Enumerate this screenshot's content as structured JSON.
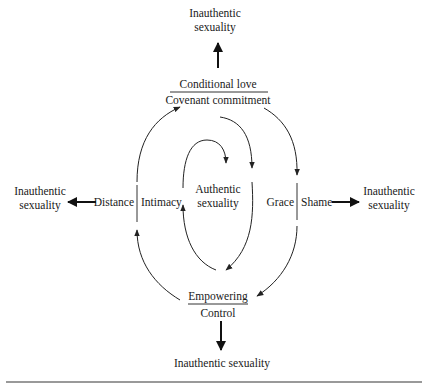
{
  "diagram": {
    "top": {
      "outcome_line1": "Inauthentic",
      "outcome_line2": "sexuality",
      "upper_label": "Conditional love",
      "lower_label": "Covenant commitment"
    },
    "left": {
      "outcome_line1": "Inauthentic",
      "outcome_line2": "sexuality",
      "outer_label": "Distance",
      "inner_label": "Intimacy"
    },
    "right": {
      "outcome_line1": "Inauthentic",
      "outcome_line2": "sexuality",
      "inner_label": "Grace",
      "outer_label": "Shame"
    },
    "bottom": {
      "upper_label": "Empowering",
      "lower_label": "Control",
      "outcome": "Inauthentic sexuality"
    },
    "center": {
      "line1": "Authentic",
      "line2": "sexuality"
    }
  }
}
